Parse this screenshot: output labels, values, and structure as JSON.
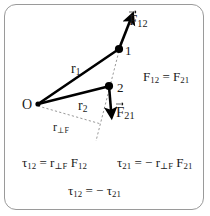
{
  "figure": {
    "title_visible": false,
    "background_color": "#ffffff",
    "border_color": "#9a9a9a",
    "ink_color": "#000000",
    "dash_color": "#8c8c8c"
  },
  "diagram": {
    "type": "physics-free-body-torque-diagram",
    "origin_label": "O",
    "points": [
      {
        "name": "point-1",
        "label": "1",
        "x": 118,
        "y": 50
      },
      {
        "name": "point-2",
        "label": "2",
        "x": 108,
        "y": 86
      }
    ],
    "position_vectors": [
      {
        "name": "r1",
        "base": "r",
        "sub": "1",
        "from": "O",
        "to": "1"
      },
      {
        "name": "r2",
        "base": "r",
        "sub": "2",
        "from": "O",
        "to": "2"
      }
    ],
    "force_vectors": [
      {
        "name": "F12",
        "base": "F",
        "sub": "12",
        "applied_at": "1",
        "direction": "up-right"
      },
      {
        "name": "F21",
        "base": "F",
        "sub": "21",
        "applied_at": "2",
        "direction": "down"
      }
    ],
    "moment_arm": {
      "base": "r",
      "sub": "⊥F"
    },
    "line_of_action_style": "dashed"
  },
  "labels": {
    "F12_vector_base": "F",
    "F12_vector_sub": "12",
    "F21_vector_base": "F",
    "F21_vector_sub": "21",
    "point_1": "1",
    "point_2": "2",
    "origin": "O",
    "r1_base": "r",
    "r1_sub": "1",
    "r2_base": "r",
    "r2_sub": "2",
    "rperp_base": "r",
    "rperp_sub": "⊥F"
  },
  "equations": {
    "force_equality": {
      "lhs_base": "F",
      "lhs_sub": "12",
      "operator": "=",
      "rhs_base": "F",
      "rhs_sub": "21",
      "plain": "F12 = F21"
    },
    "torque_12": {
      "lhs_base": "τ",
      "lhs_sub": "12",
      "operator": "=",
      "arm_base": "r",
      "arm_sub": "⊥F",
      "force_base": "F",
      "force_sub": "12",
      "plain": "τ12 = r⊥F F12"
    },
    "torque_21": {
      "lhs_base": "τ",
      "lhs_sub": "21",
      "operator": "=",
      "sign": "−",
      "arm_base": "r",
      "arm_sub": "⊥F",
      "force_base": "F",
      "force_sub": "21",
      "plain": "τ21 = − r⊥F F21"
    },
    "torque_relation": {
      "lhs_base": "τ",
      "lhs_sub": "12",
      "operator": "=",
      "sign": "−",
      "rhs_base": "τ",
      "rhs_sub": "21",
      "plain": "τ12 = − τ21"
    }
  }
}
